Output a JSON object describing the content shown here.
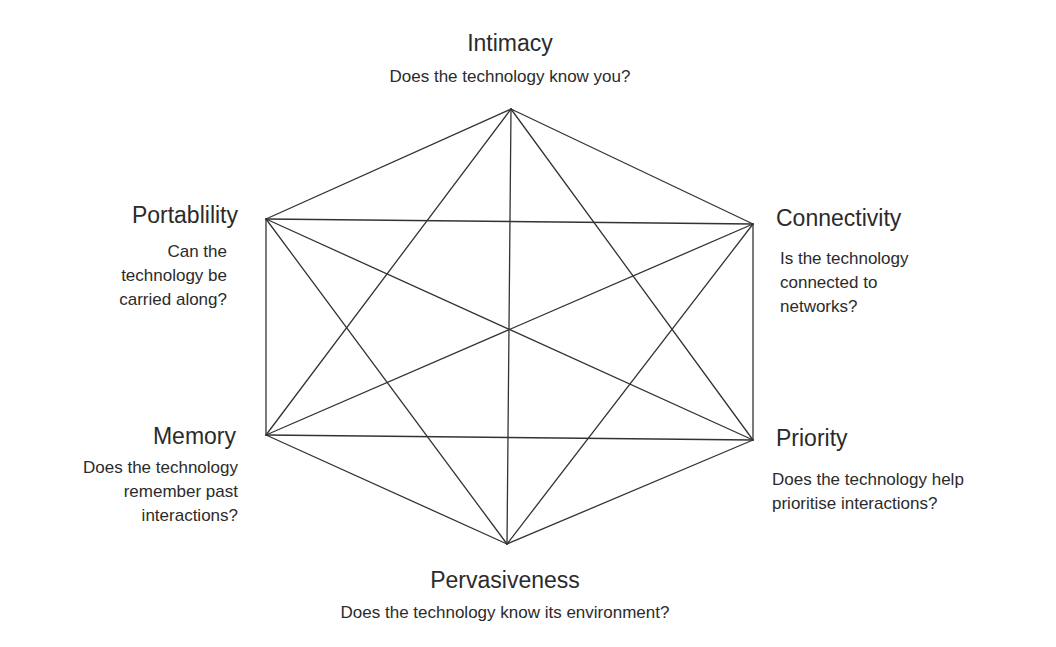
{
  "diagram": {
    "type": "hexagon-complete-graph",
    "line_color": "#333333",
    "text_color": "#2b2b2b",
    "background": "#ffffff",
    "center": {
      "x": 509,
      "y": 330
    },
    "nodes": [
      {
        "id": "intimacy",
        "title": "Intimacy",
        "description": "Does the technology know you?",
        "description_lines": [
          "Does the technology know you?"
        ],
        "position": "top",
        "vertex": {
          "x": 511,
          "y": 109
        }
      },
      {
        "id": "connectivity",
        "title": "Connectivity",
        "description": "Is the technology connected to networks?",
        "description_lines": [
          "Is the technology",
          "connected to",
          "networks?"
        ],
        "position": "upper-right",
        "vertex": {
          "x": 753,
          "y": 224
        }
      },
      {
        "id": "priority",
        "title": "Priority",
        "description": "Does the technology help prioritise interactions?",
        "description_lines": [
          "Does the technology help",
          "prioritise interactions?"
        ],
        "position": "lower-right",
        "vertex": {
          "x": 753,
          "y": 440
        }
      },
      {
        "id": "pervasiveness",
        "title": "Pervasiveness",
        "description": "Does the technology know its environment?",
        "description_lines": [
          "Does the technology know its environment?"
        ],
        "position": "bottom",
        "vertex": {
          "x": 507,
          "y": 544
        }
      },
      {
        "id": "memory",
        "title": "Memory",
        "description": "Does the technology remember past interactions?",
        "description_lines": [
          "Does the technology",
          "remember past",
          "interactions?"
        ],
        "position": "lower-left",
        "vertex": {
          "x": 266,
          "y": 435
        }
      },
      {
        "id": "portability",
        "title": "Portablility",
        "description": "Can the technology be carried along?",
        "description_lines": [
          "Can the",
          "technology be",
          "carried along?"
        ],
        "position": "upper-left",
        "vertex": {
          "x": 266,
          "y": 219
        }
      }
    ],
    "edges": "all pairs (complete graph K6): 6 perimeter edges + 9 internal diagonals"
  }
}
